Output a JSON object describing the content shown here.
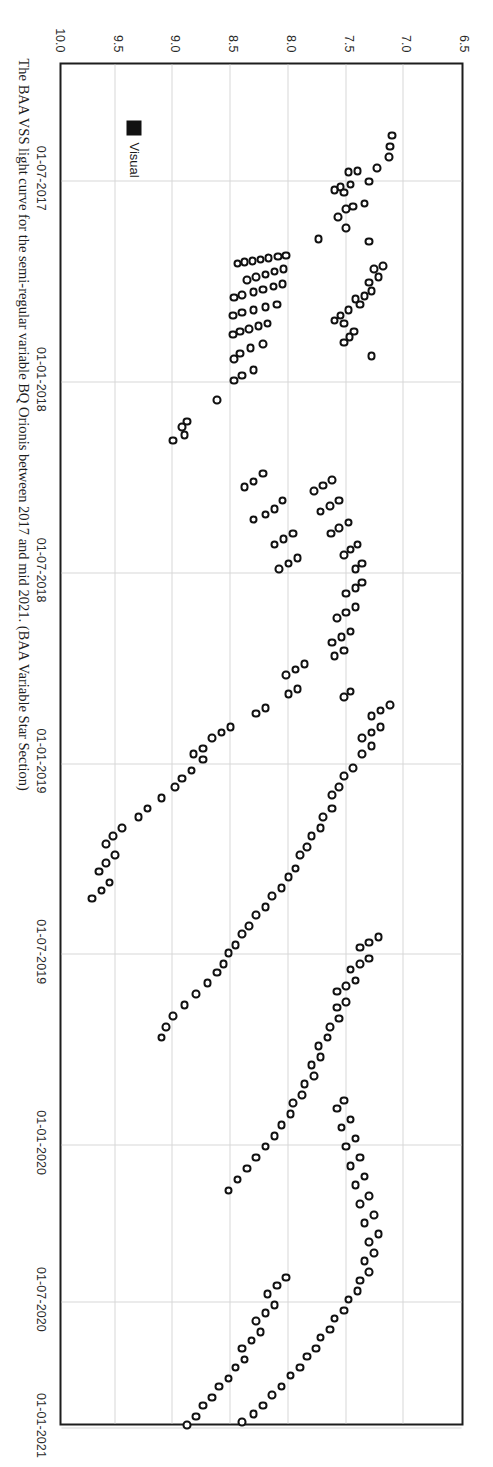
{
  "figure": {
    "caption": "The BAA VSS light curve for the semi-regular variable BQ Orionis between 2017 and mid 2021. (BAA Variable Star Section)",
    "rotation_degrees": 90
  },
  "legend": {
    "position": "bottom-left",
    "entries": [
      {
        "label": "Visual",
        "marker": "filled-square",
        "color": "#111111"
      }
    ]
  },
  "chart_data": {
    "type": "scatter",
    "title": "",
    "xlabel": "",
    "ylabel": "",
    "grid": true,
    "y_inverted": true,
    "ylim": [
      6.5,
      10.0
    ],
    "yticks": [
      "6.5",
      "7.0",
      "7.5",
      "8.0",
      "8.5",
      "9.0",
      "9.5",
      "10.0"
    ],
    "ytick_values": [
      6.5,
      7.0,
      7.5,
      8.0,
      8.5,
      9.0,
      9.5,
      10.0
    ],
    "xticks": [
      "01-07-2017",
      "01-01-2018",
      "01-07-2018",
      "01-01-2019",
      "01-07-2019",
      "01-01-2020",
      "01-07-2020",
      "01-01-2021"
    ],
    "xtick_fractions": [
      0.085,
      0.2325,
      0.3725,
      0.5125,
      0.6525,
      0.7925,
      0.9075,
      1.0
    ],
    "xlim": [
      "2017-05-01",
      "2021-07-01"
    ],
    "series": [
      {
        "name": "Visual",
        "marker": "open-circle",
        "points": [
          [
            0.052,
            7.1
          ],
          [
            0.06,
            7.12
          ],
          [
            0.068,
            7.13
          ],
          [
            0.076,
            7.23
          ],
          [
            0.078,
            7.4
          ],
          [
            0.079,
            7.48
          ],
          [
            0.086,
            7.3
          ],
          [
            0.088,
            7.46
          ],
          [
            0.09,
            7.55
          ],
          [
            0.092,
            7.6
          ],
          [
            0.094,
            7.52
          ],
          [
            0.102,
            7.34
          ],
          [
            0.104,
            7.44
          ],
          [
            0.106,
            7.5
          ],
          [
            0.112,
            7.57
          ],
          [
            0.12,
            7.5
          ],
          [
            0.128,
            7.74
          ],
          [
            0.13,
            7.3
          ],
          [
            0.14,
            8.02
          ],
          [
            0.141,
            8.09
          ],
          [
            0.142,
            8.17
          ],
          [
            0.143,
            8.24
          ],
          [
            0.144,
            8.31
          ],
          [
            0.145,
            8.38
          ],
          [
            0.146,
            8.44
          ],
          [
            0.15,
            8.04
          ],
          [
            0.152,
            8.12
          ],
          [
            0.154,
            8.2
          ],
          [
            0.156,
            8.28
          ],
          [
            0.158,
            8.36
          ],
          [
            0.161,
            8.05
          ],
          [
            0.163,
            8.13
          ],
          [
            0.165,
            8.22
          ],
          [
            0.167,
            8.3
          ],
          [
            0.169,
            8.4
          ],
          [
            0.171,
            8.47
          ],
          [
            0.176,
            8.1
          ],
          [
            0.178,
            8.2
          ],
          [
            0.18,
            8.3
          ],
          [
            0.182,
            8.4
          ],
          [
            0.184,
            8.48
          ],
          [
            0.19,
            8.18
          ],
          [
            0.192,
            8.26
          ],
          [
            0.194,
            8.34
          ],
          [
            0.196,
            8.42
          ],
          [
            0.198,
            8.48
          ],
          [
            0.205,
            8.22
          ],
          [
            0.208,
            8.33
          ],
          [
            0.212,
            8.42
          ],
          [
            0.216,
            8.47
          ],
          [
            0.224,
            8.3
          ],
          [
            0.228,
            8.4
          ],
          [
            0.232,
            8.47
          ],
          [
            0.246,
            8.62
          ],
          [
            0.262,
            8.88
          ],
          [
            0.266,
            8.92
          ],
          [
            0.272,
            8.9
          ],
          [
            0.276,
            9.0
          ],
          [
            0.214,
            7.28
          ],
          [
            0.196,
            7.43
          ],
          [
            0.2,
            7.47
          ],
          [
            0.204,
            7.52
          ],
          [
            0.176,
            7.38
          ],
          [
            0.18,
            7.48
          ],
          [
            0.184,
            7.55
          ],
          [
            0.188,
            7.6
          ],
          [
            0.19,
            7.52
          ],
          [
            0.166,
            7.28
          ],
          [
            0.17,
            7.34
          ],
          [
            0.172,
            7.42
          ],
          [
            0.156,
            7.22
          ],
          [
            0.16,
            7.3
          ],
          [
            0.148,
            7.18
          ],
          [
            0.15,
            7.26
          ],
          [
            0.3,
            8.22
          ],
          [
            0.306,
            8.3
          ],
          [
            0.31,
            8.38
          ],
          [
            0.32,
            8.05
          ],
          [
            0.326,
            8.12
          ],
          [
            0.33,
            8.2
          ],
          [
            0.334,
            8.3
          ],
          [
            0.344,
            7.96
          ],
          [
            0.348,
            8.04
          ],
          [
            0.352,
            8.12
          ],
          [
            0.362,
            7.92
          ],
          [
            0.366,
            8.0
          ],
          [
            0.37,
            8.08
          ],
          [
            0.305,
            7.62
          ],
          [
            0.309,
            7.7
          ],
          [
            0.313,
            7.78
          ],
          [
            0.32,
            7.56
          ],
          [
            0.324,
            7.64
          ],
          [
            0.328,
            7.72
          ],
          [
            0.336,
            7.48
          ],
          [
            0.34,
            7.56
          ],
          [
            0.344,
            7.63
          ],
          [
            0.352,
            7.4
          ],
          [
            0.356,
            7.46
          ],
          [
            0.36,
            7.52
          ],
          [
            0.366,
            7.36
          ],
          [
            0.37,
            7.42
          ],
          [
            0.38,
            7.36
          ],
          [
            0.384,
            7.42
          ],
          [
            0.388,
            7.5
          ],
          [
            0.398,
            7.42
          ],
          [
            0.402,
            7.5
          ],
          [
            0.406,
            7.58
          ],
          [
            0.416,
            7.46
          ],
          [
            0.42,
            7.54
          ],
          [
            0.424,
            7.62
          ],
          [
            0.43,
            7.52
          ],
          [
            0.434,
            7.6
          ],
          [
            0.44,
            7.86
          ],
          [
            0.444,
            7.94
          ],
          [
            0.448,
            8.02
          ],
          [
            0.458,
            7.92
          ],
          [
            0.462,
            8.0
          ],
          [
            0.472,
            8.2
          ],
          [
            0.476,
            8.28
          ],
          [
            0.486,
            8.5
          ],
          [
            0.49,
            8.58
          ],
          [
            0.494,
            8.66
          ],
          [
            0.502,
            8.74
          ],
          [
            0.506,
            8.82
          ],
          [
            0.51,
            8.74
          ],
          [
            0.518,
            8.84
          ],
          [
            0.524,
            8.92
          ],
          [
            0.53,
            8.98
          ],
          [
            0.538,
            9.1
          ],
          [
            0.546,
            9.22
          ],
          [
            0.552,
            9.3
          ],
          [
            0.56,
            9.44
          ],
          [
            0.566,
            9.52
          ],
          [
            0.572,
            9.58
          ],
          [
            0.58,
            9.5
          ],
          [
            0.586,
            9.58
          ],
          [
            0.592,
            9.64
          ],
          [
            0.6,
            9.55
          ],
          [
            0.606,
            9.62
          ],
          [
            0.612,
            9.7
          ],
          [
            0.47,
            7.12
          ],
          [
            0.474,
            7.2
          ],
          [
            0.478,
            7.28
          ],
          [
            0.486,
            7.2
          ],
          [
            0.49,
            7.28
          ],
          [
            0.494,
            7.36
          ],
          [
            0.5,
            7.28
          ],
          [
            0.506,
            7.36
          ],
          [
            0.46,
            7.46
          ],
          [
            0.464,
            7.52
          ],
          [
            0.516,
            7.44
          ],
          [
            0.522,
            7.52
          ],
          [
            0.53,
            7.56
          ],
          [
            0.536,
            7.62
          ],
          [
            0.546,
            7.62
          ],
          [
            0.552,
            7.7
          ],
          [
            0.56,
            7.72
          ],
          [
            0.566,
            7.8
          ],
          [
            0.574,
            7.84
          ],
          [
            0.58,
            7.9
          ],
          [
            0.59,
            7.94
          ],
          [
            0.596,
            8.0
          ],
          [
            0.604,
            8.06
          ],
          [
            0.61,
            8.14
          ],
          [
            0.618,
            8.2
          ],
          [
            0.624,
            8.28
          ],
          [
            0.632,
            8.34
          ],
          [
            0.638,
            8.4
          ],
          [
            0.646,
            8.46
          ],
          [
            0.652,
            8.52
          ],
          [
            0.66,
            8.56
          ],
          [
            0.666,
            8.62
          ],
          [
            0.674,
            8.7
          ],
          [
            0.682,
            8.8
          ],
          [
            0.69,
            8.9
          ],
          [
            0.698,
            9.0
          ],
          [
            0.706,
            9.06
          ],
          [
            0.714,
            9.1
          ],
          [
            0.64,
            7.22
          ],
          [
            0.644,
            7.3
          ],
          [
            0.648,
            7.38
          ],
          [
            0.656,
            7.3
          ],
          [
            0.66,
            7.38
          ],
          [
            0.664,
            7.46
          ],
          [
            0.672,
            7.42
          ],
          [
            0.676,
            7.5
          ],
          [
            0.68,
            7.58
          ],
          [
            0.688,
            7.5
          ],
          [
            0.692,
            7.58
          ],
          [
            0.7,
            7.56
          ],
          [
            0.706,
            7.64
          ],
          [
            0.714,
            7.66
          ],
          [
            0.72,
            7.74
          ],
          [
            0.728,
            7.72
          ],
          [
            0.734,
            7.8
          ],
          [
            0.742,
            7.78
          ],
          [
            0.748,
            7.86
          ],
          [
            0.756,
            7.88
          ],
          [
            0.762,
            7.96
          ],
          [
            0.77,
            7.98
          ],
          [
            0.778,
            8.06
          ],
          [
            0.786,
            8.12
          ],
          [
            0.794,
            8.2
          ],
          [
            0.802,
            8.28
          ],
          [
            0.81,
            8.36
          ],
          [
            0.818,
            8.44
          ],
          [
            0.826,
            8.52
          ],
          [
            0.76,
            7.52
          ],
          [
            0.766,
            7.58
          ],
          [
            0.774,
            7.46
          ],
          [
            0.78,
            7.54
          ],
          [
            0.788,
            7.42
          ],
          [
            0.794,
            7.5
          ],
          [
            0.802,
            7.38
          ],
          [
            0.808,
            7.46
          ],
          [
            0.816,
            7.34
          ],
          [
            0.822,
            7.42
          ],
          [
            0.83,
            7.3
          ],
          [
            0.836,
            7.38
          ],
          [
            0.844,
            7.26
          ],
          [
            0.85,
            7.34
          ],
          [
            0.858,
            7.22
          ],
          [
            0.864,
            7.3
          ],
          [
            0.872,
            7.26
          ],
          [
            0.878,
            7.34
          ],
          [
            0.886,
            7.3
          ],
          [
            0.892,
            7.38
          ],
          [
            0.9,
            7.4
          ],
          [
            0.906,
            7.48
          ],
          [
            0.914,
            7.52
          ],
          [
            0.92,
            7.6
          ],
          [
            0.928,
            7.64
          ],
          [
            0.934,
            7.72
          ],
          [
            0.942,
            7.76
          ],
          [
            0.948,
            7.84
          ],
          [
            0.956,
            7.9
          ],
          [
            0.962,
            7.98
          ],
          [
            0.97,
            8.06
          ],
          [
            0.976,
            8.14
          ],
          [
            0.984,
            8.22
          ],
          [
            0.99,
            8.3
          ],
          [
            0.996,
            8.4
          ],
          [
            0.89,
            8.02
          ],
          [
            0.896,
            8.1
          ],
          [
            0.902,
            8.18
          ],
          [
            0.91,
            8.12
          ],
          [
            0.916,
            8.2
          ],
          [
            0.922,
            8.28
          ],
          [
            0.93,
            8.24
          ],
          [
            0.936,
            8.32
          ],
          [
            0.942,
            8.4
          ],
          [
            0.95,
            8.38
          ],
          [
            0.956,
            8.46
          ],
          [
            0.964,
            8.52
          ],
          [
            0.97,
            8.6
          ],
          [
            0.978,
            8.66
          ],
          [
            0.984,
            8.74
          ],
          [
            0.992,
            8.8
          ],
          [
            0.998,
            8.88
          ]
        ]
      }
    ]
  }
}
